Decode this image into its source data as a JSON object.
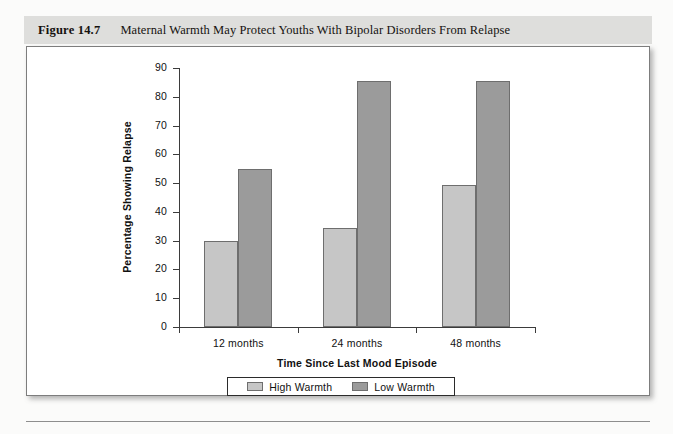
{
  "caption": {
    "figure_number": "Figure 14.7",
    "title": "Maternal Warmth May Protect Youths With Bipolar Disorders From Relapse"
  },
  "chart_data": {
    "type": "bar",
    "title": "Maternal Warmth May Protect Youths With Bipolar Disorders From Relapse",
    "xlabel": "Time Since Last Mood Episode",
    "ylabel": "Percentage Showing Relapse",
    "categories": [
      "12 months",
      "24 months",
      "48 months"
    ],
    "series": [
      {
        "name": "High Warmth",
        "color": "#c6c6c6",
        "values": [
          30,
          34.5,
          49.5
        ]
      },
      {
        "name": "Low Warmth",
        "color": "#9b9b9b",
        "values": [
          55,
          85.5,
          85.5
        ]
      }
    ],
    "ylim": [
      0,
      90
    ],
    "yticks": [
      0,
      10,
      20,
      30,
      40,
      50,
      60,
      70,
      80,
      90
    ],
    "ytick_labels": [
      "0",
      "10",
      "20",
      "30",
      "40",
      "50",
      "60",
      "70",
      "80",
      "90"
    ],
    "grid": false,
    "legend_position": "bottom"
  }
}
